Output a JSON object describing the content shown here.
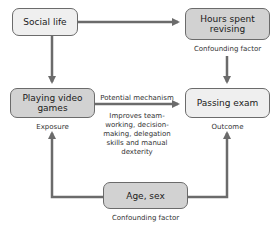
{
  "nodes": {
    "social_life": {
      "label": "Social life"
    },
    "hours_revising": {
      "label": "Hours spent revising",
      "caption": "Confounding factor"
    },
    "playing_games": {
      "label": "Playing video games",
      "caption": "Exposure"
    },
    "passing_exam": {
      "label": "Passing exam",
      "caption": "Outcome"
    },
    "age_sex": {
      "label": "Age, sex",
      "caption": "Confounding factor"
    }
  },
  "edges": {
    "mechanism_label": "Potential mechanism",
    "mechanism_detail": "Improves team-working, decision-making, delegation skills and manual dexterity"
  },
  "colors": {
    "line": "#6b6b6b",
    "box_light": "#efefef",
    "box_dark": "#d2d2d2"
  }
}
